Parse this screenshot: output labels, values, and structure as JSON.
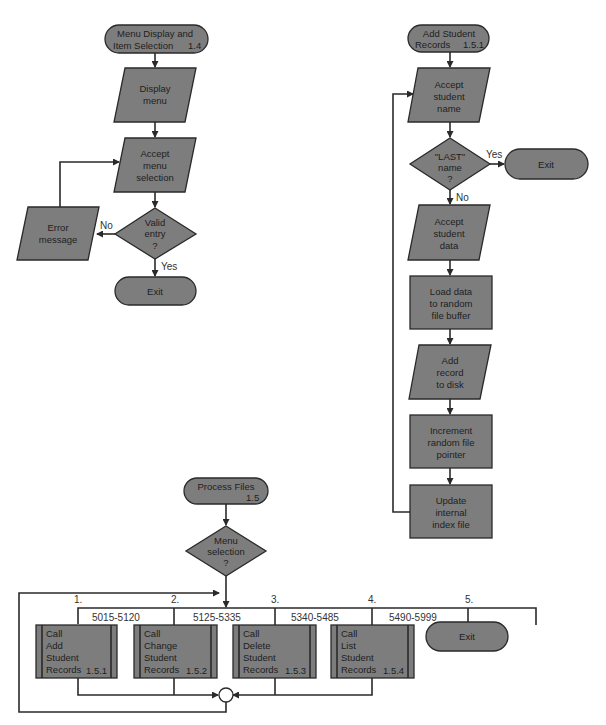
{
  "colors": {
    "shape_fill": "#7d7d7d",
    "line": "#2a2a2a",
    "background": "#ffffff"
  },
  "menu_chart": {
    "start": {
      "line1": "Menu Display and",
      "line2": "Item Selection",
      "id": "1.4"
    },
    "display_menu": {
      "line1": "Display",
      "line2": "menu"
    },
    "accept_selection": {
      "line1": "Accept",
      "line2": "menu",
      "line3": "selection"
    },
    "decision": {
      "line1": "Valid",
      "line2": "entry",
      "line3": "?"
    },
    "no_label": "No",
    "yes_label": "Yes",
    "error": {
      "line1": "Error",
      "line2": "message"
    },
    "exit": "Exit"
  },
  "add_chart": {
    "start": {
      "line1": "Add Student",
      "line2": "Records",
      "id": "1.5.1"
    },
    "accept_name": {
      "line1": "Accept",
      "line2": "student",
      "line3": "name"
    },
    "decision": {
      "line1": "\"LAST\"",
      "line2": "name",
      "line3": "?"
    },
    "yes_label": "Yes",
    "no_label": "No",
    "exit": "Exit",
    "accept_data": {
      "line1": "Accept",
      "line2": "student",
      "line3": "data"
    },
    "load_data": {
      "line1": "Load data",
      "line2": "to random",
      "line3": "file buffer"
    },
    "add_record": {
      "line1": "Add",
      "line2": "record",
      "line3": "to disk"
    },
    "increment": {
      "line1": "Increment",
      "line2": "random file",
      "line3": "pointer"
    },
    "update": {
      "line1": "Update",
      "line2": "internal",
      "line3": "index file"
    }
  },
  "process_chart": {
    "start": {
      "line1": "Process Files",
      "id": "1.5"
    },
    "decision": {
      "line1": "Menu",
      "line2": "selection",
      "line3": "?"
    },
    "branches": [
      {
        "num": "1.",
        "range": "5015-5120",
        "l1": "Call",
        "l2": "Add",
        "l3": "Student",
        "l4": "Records",
        "id": "1.5.1"
      },
      {
        "num": "2.",
        "range": "5125-5335",
        "l1": "Call",
        "l2": "Change",
        "l3": "Student",
        "l4": "Records",
        "id": "1.5.2"
      },
      {
        "num": "3.",
        "range": "5340-5485",
        "l1": "Call",
        "l2": "Delete",
        "l3": "Student",
        "l4": "Records",
        "id": "1.5.3"
      },
      {
        "num": "4.",
        "range": "5490-5999",
        "l1": "Call",
        "l2": "List",
        "l3": "Student",
        "l4": "Records",
        "id": "1.5.4"
      },
      {
        "num": "5.",
        "exit": "Exit"
      }
    ]
  }
}
